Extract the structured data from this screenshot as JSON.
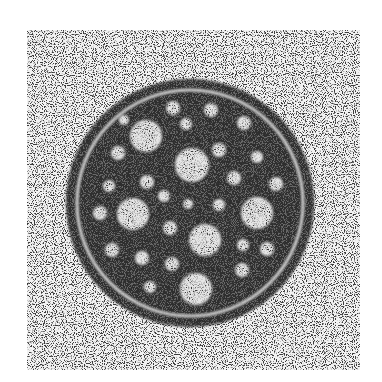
{
  "image": {
    "description": "Grayscale grainy micrograph of a circular cross-section with a dark body, concentric outer ring, and light circular inclusions",
    "colors": {
      "page_background": "#ffffff",
      "field_light": "#f2f2f2",
      "grain_dark": "#3a3a3a",
      "body_dark": "#2e2e2e",
      "inclusion_light": "#e6e6e6",
      "ring_light": "#d8d8d8"
    },
    "field": {
      "x": 27,
      "y": 30,
      "width": 333,
      "height": 340
    },
    "outer_circle": {
      "cx": 190,
      "cy": 203,
      "r": 124
    },
    "ring": {
      "cx": 190,
      "cy": 203,
      "r": 113,
      "stroke_width": 3
    },
    "inner_body": {
      "cx": 190,
      "cy": 203,
      "r": 110
    },
    "inclusions": [
      {
        "cx": 146,
        "cy": 136,
        "r": 16
      },
      {
        "cx": 192,
        "cy": 165,
        "r": 17
      },
      {
        "cx": 133,
        "cy": 214,
        "r": 16
      },
      {
        "cx": 257,
        "cy": 213,
        "r": 16
      },
      {
        "cx": 205,
        "cy": 240,
        "r": 16
      },
      {
        "cx": 196,
        "cy": 289,
        "r": 16
      },
      {
        "cx": 118,
        "cy": 153,
        "r": 7
      },
      {
        "cx": 109,
        "cy": 186,
        "r": 6
      },
      {
        "cx": 147,
        "cy": 182,
        "r": 7
      },
      {
        "cx": 173,
        "cy": 108,
        "r": 7
      },
      {
        "cx": 186,
        "cy": 124,
        "r": 6
      },
      {
        "cx": 211,
        "cy": 110,
        "r": 7
      },
      {
        "cx": 244,
        "cy": 123,
        "r": 7
      },
      {
        "cx": 219,
        "cy": 150,
        "r": 7
      },
      {
        "cx": 257,
        "cy": 157,
        "r": 6
      },
      {
        "cx": 234,
        "cy": 178,
        "r": 7
      },
      {
        "cx": 276,
        "cy": 184,
        "r": 7
      },
      {
        "cx": 100,
        "cy": 213,
        "r": 7
      },
      {
        "cx": 164,
        "cy": 196,
        "r": 6
      },
      {
        "cx": 188,
        "cy": 204,
        "r": 5
      },
      {
        "cx": 219,
        "cy": 205,
        "r": 6
      },
      {
        "cx": 170,
        "cy": 228,
        "r": 7
      },
      {
        "cx": 112,
        "cy": 250,
        "r": 7
      },
      {
        "cx": 142,
        "cy": 258,
        "r": 7
      },
      {
        "cx": 172,
        "cy": 264,
        "r": 7
      },
      {
        "cx": 243,
        "cy": 245,
        "r": 6
      },
      {
        "cx": 267,
        "cy": 249,
        "r": 7
      },
      {
        "cx": 242,
        "cy": 270,
        "r": 7
      },
      {
        "cx": 150,
        "cy": 287,
        "r": 6
      },
      {
        "cx": 124,
        "cy": 120,
        "r": 5
      }
    ]
  }
}
